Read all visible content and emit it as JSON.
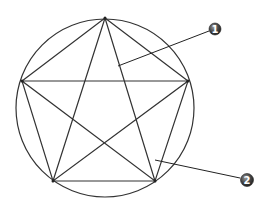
{
  "diagram": {
    "type": "pentagram-in-circle",
    "stroke_color": "#333333",
    "circle": {
      "cx": 105,
      "cy": 108,
      "r": 89
    },
    "vertices": [
      {
        "name": "top",
        "x": 105,
        "y": 18
      },
      {
        "name": "right",
        "x": 188,
        "y": 81
      },
      {
        "name": "bottom-right",
        "x": 155,
        "y": 181
      },
      {
        "name": "bottom-left",
        "x": 53,
        "y": 181
      },
      {
        "name": "left",
        "x": 22,
        "y": 81
      }
    ],
    "callouts": [
      {
        "label": "1",
        "marker": {
          "x": 215,
          "y": 29
        },
        "leader_from": {
          "x": 118,
          "y": 66
        },
        "leader_to": {
          "x": 209,
          "y": 31
        },
        "target": "star-line"
      },
      {
        "label": "2",
        "marker": {
          "x": 247,
          "y": 180
        },
        "leader_from": {
          "x": 155,
          "y": 160
        },
        "leader_to": {
          "x": 240,
          "y": 178
        },
        "target": "pentagon-region"
      }
    ],
    "marker_fill": "#444444"
  }
}
